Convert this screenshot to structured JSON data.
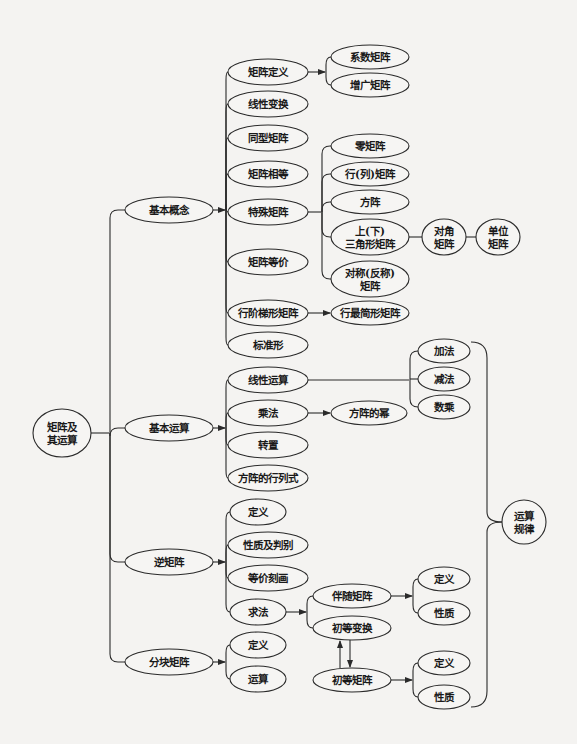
{
  "diagram": {
    "type": "mind-map",
    "colors": {
      "background": "#f4f3f1",
      "line": "#2a2a2a",
      "node_fill": "#f6f5f3",
      "text": "#1a1a1a"
    },
    "root": {
      "id": "root",
      "lines": [
        "矩阵及",
        "其运算"
      ],
      "cx": 62,
      "cy": 433,
      "rx": 29,
      "ry": 24
    },
    "nodes": [
      {
        "id": "jbgn",
        "lines": [
          "基本概念"
        ],
        "cx": 169,
        "cy": 210,
        "rx": 44,
        "ry": 13
      },
      {
        "id": "jbys",
        "lines": [
          "基本运算"
        ],
        "cx": 169,
        "cy": 428,
        "rx": 44,
        "ry": 13
      },
      {
        "id": "njz",
        "lines": [
          "逆矩阵"
        ],
        "cx": 169,
        "cy": 562,
        "rx": 44,
        "ry": 13
      },
      {
        "id": "fkjz",
        "lines": [
          "分块矩阵"
        ],
        "cx": 169,
        "cy": 662,
        "rx": 44,
        "ry": 13
      },
      {
        "id": "jzdy",
        "lines": [
          "矩阵定义"
        ],
        "cx": 268,
        "cy": 72,
        "rx": 40,
        "ry": 13
      },
      {
        "id": "xxbh",
        "lines": [
          "线性变换"
        ],
        "cx": 268,
        "cy": 104,
        "rx": 40,
        "ry": 13
      },
      {
        "id": "txjz",
        "lines": [
          "同型矩阵"
        ],
        "cx": 268,
        "cy": 138,
        "rx": 40,
        "ry": 13
      },
      {
        "id": "jzxd",
        "lines": [
          "矩阵相等"
        ],
        "cx": 268,
        "cy": 174,
        "rx": 40,
        "ry": 13
      },
      {
        "id": "tsjz",
        "lines": [
          "特殊矩阵"
        ],
        "cx": 268,
        "cy": 212,
        "rx": 40,
        "ry": 13
      },
      {
        "id": "jzdj",
        "lines": [
          "矩阵等价"
        ],
        "cx": 268,
        "cy": 262,
        "rx": 40,
        "ry": 13
      },
      {
        "id": "hjtx",
        "lines": [
          "行阶梯形矩阵"
        ],
        "cx": 268,
        "cy": 313,
        "rx": 40,
        "ry": 13
      },
      {
        "id": "bzx",
        "lines": [
          "标准形"
        ],
        "cx": 268,
        "cy": 345,
        "rx": 40,
        "ry": 13
      },
      {
        "id": "xsys",
        "lines": [
          "线性运算"
        ],
        "cx": 268,
        "cy": 380,
        "rx": 40,
        "ry": 13
      },
      {
        "id": "cf",
        "lines": [
          "乘法"
        ],
        "cx": 268,
        "cy": 413,
        "rx": 40,
        "ry": 13
      },
      {
        "id": "zz",
        "lines": [
          "转置"
        ],
        "cx": 268,
        "cy": 445,
        "rx": 40,
        "ry": 13
      },
      {
        "id": "fzhls",
        "lines": [
          "方阵的行列式"
        ],
        "cx": 268,
        "cy": 478,
        "rx": 40,
        "ry": 13
      },
      {
        "id": "nj_dy",
        "lines": [
          "定义"
        ],
        "cx": 258,
        "cy": 512,
        "rx": 28,
        "ry": 13
      },
      {
        "id": "nj_xz",
        "lines": [
          "性质及判别"
        ],
        "cx": 268,
        "cy": 545,
        "rx": 40,
        "ry": 13
      },
      {
        "id": "nj_djkh",
        "lines": [
          "等价刻画"
        ],
        "cx": 268,
        "cy": 578,
        "rx": 40,
        "ry": 13
      },
      {
        "id": "nj_qf",
        "lines": [
          "求法"
        ],
        "cx": 258,
        "cy": 612,
        "rx": 28,
        "ry": 13
      },
      {
        "id": "fk_dy",
        "lines": [
          "定义"
        ],
        "cx": 258,
        "cy": 645,
        "rx": 28,
        "ry": 13
      },
      {
        "id": "fk_ys",
        "lines": [
          "运算"
        ],
        "cx": 258,
        "cy": 679,
        "rx": 28,
        "ry": 13
      },
      {
        "id": "xsjz",
        "lines": [
          "系数矩阵"
        ],
        "cx": 370,
        "cy": 57,
        "rx": 39,
        "ry": 12
      },
      {
        "id": "zgjz",
        "lines": [
          "增广矩阵"
        ],
        "cx": 370,
        "cy": 85,
        "rx": 39,
        "ry": 12
      },
      {
        "id": "ljz",
        "lines": [
          "零矩阵"
        ],
        "cx": 370,
        "cy": 146,
        "rx": 39,
        "ry": 12
      },
      {
        "id": "hljz",
        "lines": [
          "行(列)矩阵"
        ],
        "cx": 370,
        "cy": 174,
        "rx": 39,
        "ry": 12
      },
      {
        "id": "fz",
        "lines": [
          "方阵"
        ],
        "cx": 370,
        "cy": 202,
        "rx": 39,
        "ry": 12
      },
      {
        "id": "sxjx",
        "lines": [
          "上(下)",
          "三角形矩阵"
        ],
        "cx": 370,
        "cy": 237,
        "rx": 39,
        "ry": 18
      },
      {
        "id": "dcfc",
        "lines": [
          "对称(反称)",
          "矩阵"
        ],
        "cx": 370,
        "cy": 279,
        "rx": 39,
        "ry": 18
      },
      {
        "id": "djjz",
        "lines": [
          "对角",
          "矩阵"
        ],
        "cx": 444,
        "cy": 237,
        "rx": 22,
        "ry": 18
      },
      {
        "id": "dwjz",
        "lines": [
          "单位",
          "矩阵"
        ],
        "cx": 498,
        "cy": 237,
        "rx": 22,
        "ry": 18
      },
      {
        "id": "hzjx",
        "lines": [
          "行最简形矩阵"
        ],
        "cx": 370,
        "cy": 313,
        "rx": 39,
        "ry": 12
      },
      {
        "id": "jf",
        "lines": [
          "加法"
        ],
        "cx": 444,
        "cy": 351,
        "rx": 26,
        "ry": 12
      },
      {
        "id": "jianf",
        "lines": [
          "减法"
        ],
        "cx": 444,
        "cy": 379,
        "rx": 26,
        "ry": 12
      },
      {
        "id": "sc",
        "lines": [
          "数乘"
        ],
        "cx": 444,
        "cy": 407,
        "rx": 26,
        "ry": 12
      },
      {
        "id": "fzdm",
        "lines": [
          "方阵的幂"
        ],
        "cx": 369,
        "cy": 413,
        "rx": 38,
        "ry": 12
      },
      {
        "id": "ysgl",
        "lines": [
          "运算",
          "规律"
        ],
        "cx": 524,
        "cy": 522,
        "rx": 22,
        "ry": 22
      },
      {
        "id": "bsjz",
        "lines": [
          "伴随矩阵"
        ],
        "cx": 352,
        "cy": 596,
        "rx": 39,
        "ry": 12
      },
      {
        "id": "cdbh",
        "lines": [
          "初等变换"
        ],
        "cx": 352,
        "cy": 628,
        "rx": 39,
        "ry": 12
      },
      {
        "id": "cdjz",
        "lines": [
          "初等矩阵"
        ],
        "cx": 352,
        "cy": 680,
        "rx": 39,
        "ry": 12
      },
      {
        "id": "bs_dy",
        "lines": [
          "定义"
        ],
        "cx": 444,
        "cy": 579,
        "rx": 26,
        "ry": 12
      },
      {
        "id": "bs_xz",
        "lines": [
          "性质"
        ],
        "cx": 444,
        "cy": 613,
        "rx": 26,
        "ry": 12
      },
      {
        "id": "cd_dy",
        "lines": [
          "定义"
        ],
        "cx": 444,
        "cy": 663,
        "rx": 26,
        "ry": 12
      },
      {
        "id": "cd_xz",
        "lines": [
          "性质"
        ],
        "cx": 444,
        "cy": 697,
        "rx": 26,
        "ry": 12
      }
    ],
    "groups": [
      {
        "from": "root",
        "arrow": false,
        "spine_x": 110,
        "targets": [
          "jbgn",
          "jbys",
          "njz",
          "fkjz"
        ]
      },
      {
        "from": "jbgn",
        "arrow": true,
        "spine_x": 226,
        "targets": [
          "jzdy",
          "xxbh",
          "txjz",
          "jzxd",
          "tsjz",
          "jzdj",
          "hjtx",
          "bzx"
        ]
      },
      {
        "from": "jbys",
        "arrow": true,
        "spine_x": 226,
        "targets": [
          "xsys",
          "cf",
          "zz",
          "fzhls"
        ]
      },
      {
        "from": "njz",
        "arrow": true,
        "spine_x": 226,
        "targets": [
          "nj_dy",
          "nj_xz",
          "nj_djkh",
          "nj_qf"
        ]
      },
      {
        "from": "fkjz",
        "arrow": true,
        "spine_x": 226,
        "targets": [
          "fk_dy",
          "fk_ys"
        ]
      },
      {
        "from": "jzdy",
        "arrow": true,
        "spine_x": 326,
        "targets": [
          "xsjz",
          "zgjz"
        ]
      },
      {
        "from": "tsjz",
        "arrow": false,
        "spine_x": 322,
        "targets": [
          "ljz",
          "hljz",
          "fz",
          "sxjx",
          "dcfc"
        ]
      },
      {
        "from": "xsys",
        "arrow": false,
        "spine_x": 410,
        "targets": [
          "jf",
          "jianf",
          "sc"
        ]
      },
      {
        "from": "nj_qf",
        "arrow": true,
        "spine_x": 307,
        "targets": [
          "bsjz",
          "cdbh"
        ]
      },
      {
        "from": "bsjz",
        "arrow": true,
        "spine_x": 413,
        "targets": [
          "bs_dy",
          "bs_xz"
        ]
      },
      {
        "from": "cdjz",
        "arrow": true,
        "spine_x": 413,
        "targets": [
          "cd_dy",
          "cd_xz"
        ]
      }
    ],
    "links": [
      {
        "from": "hjtx",
        "to": "hzjx",
        "arrow": true
      },
      {
        "from": "cf",
        "to": "fzdm",
        "arrow": true
      },
      {
        "from": "sxjx",
        "to": "djjz",
        "arrow": false
      },
      {
        "from": "djjz",
        "to": "dwjz",
        "arrow": false
      }
    ],
    "bracket": {
      "label_node": "ysgl",
      "top_y": 342,
      "bottom_y": 707,
      "x": 487,
      "start_x": 471
    },
    "bidirectional": {
      "a": "cdbh",
      "b": "cdjz"
    }
  }
}
